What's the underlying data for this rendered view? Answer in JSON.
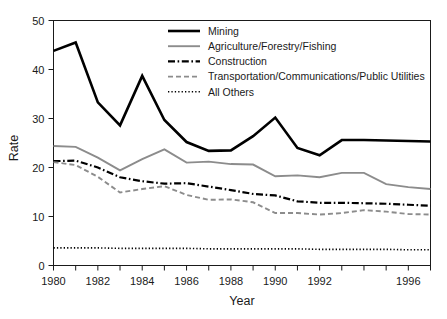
{
  "chart_data": {
    "type": "line",
    "title": "",
    "xlabel": "Year",
    "ylabel": "Rate",
    "xlim": [
      1980,
      1997
    ],
    "ylim": [
      0,
      50
    ],
    "grid": false,
    "legend_position": "top-right",
    "x": [
      1980,
      1981,
      1982,
      1983,
      1984,
      1985,
      1986,
      1987,
      1988,
      1989,
      1990,
      1991,
      1992,
      1993,
      1994,
      1995,
      1996,
      1997
    ],
    "xtick_labels": [
      "1980",
      "1982",
      "1984",
      "1986",
      "1988",
      "1990",
      "1992",
      "1996"
    ],
    "xtick_values": [
      1980,
      1982,
      1984,
      1986,
      1988,
      1990,
      1992,
      1996
    ],
    "ytick_labels": [
      "0",
      "10",
      "20",
      "30",
      "40",
      "50"
    ],
    "ytick_values": [
      0,
      10,
      20,
      30,
      40,
      50
    ],
    "series": [
      {
        "name": "Mining",
        "style": "solid-thick-black",
        "color": "#000000",
        "values": [
          43.8,
          45.5,
          33.3,
          28.6,
          38.7,
          29.7,
          25.2,
          23.4,
          23.5,
          26.4,
          30.2,
          24.0,
          22.5,
          25.6,
          25.6,
          25.5,
          25.4,
          25.3
        ]
      },
      {
        "name": "Agriculture/Forestry/Fishing",
        "style": "solid-gray",
        "color": "#8c8c8c",
        "values": [
          24.4,
          24.2,
          22.0,
          19.4,
          21.7,
          23.7,
          21.0,
          21.2,
          20.7,
          20.6,
          18.2,
          18.4,
          18.0,
          18.9,
          18.9,
          16.6,
          16.0,
          15.6
        ]
      },
      {
        "name": "Construction",
        "style": "dash-dot-black",
        "color": "#000000",
        "values": [
          21.3,
          21.4,
          20.0,
          18.0,
          17.2,
          16.7,
          16.8,
          16.1,
          15.4,
          14.6,
          14.3,
          13.1,
          12.8,
          12.8,
          12.7,
          12.6,
          12.4,
          12.2
        ]
      },
      {
        "name": "Transportation/Communications/Public Utilities",
        "style": "dashed-gray",
        "color": "#8c8c8c",
        "values": [
          21.1,
          20.5,
          18.1,
          14.9,
          15.6,
          16.2,
          14.4,
          13.4,
          13.5,
          12.9,
          10.7,
          10.7,
          10.4,
          10.7,
          11.3,
          11.0,
          10.5,
          10.4
        ]
      },
      {
        "name": "All Others",
        "style": "dotted-black",
        "color": "#000000",
        "values": [
          3.6,
          3.6,
          3.6,
          3.5,
          3.5,
          3.5,
          3.5,
          3.4,
          3.4,
          3.4,
          3.4,
          3.4,
          3.3,
          3.3,
          3.3,
          3.3,
          3.2,
          3.2
        ]
      }
    ]
  },
  "axes": {
    "y_title": "Rate",
    "x_title": "Year"
  },
  "legend": {
    "entries": [
      {
        "label": "Mining"
      },
      {
        "label": "Agriculture/Forestry/Fishing"
      },
      {
        "label": "Construction"
      },
      {
        "label": "Transportation/Communications/Public Utilities"
      },
      {
        "label": "All Others"
      }
    ]
  }
}
